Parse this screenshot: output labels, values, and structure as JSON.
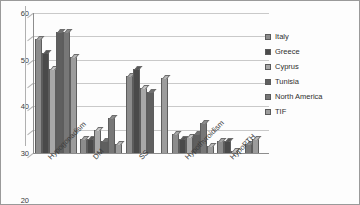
{
  "chart_data": {
    "type": "bar",
    "title": "",
    "subtitle": "",
    "xlabel": "",
    "ylabel": "",
    "ylim": [
      0,
      60
    ],
    "yticks": [
      0,
      10,
      20,
      30,
      40,
      50,
      60
    ],
    "grid": true,
    "legend_position": "right",
    "categories": [
      "Hypogonadism",
      "DM",
      "SS",
      "Hypothyroidism",
      "HypoPTH"
    ],
    "series": [
      {
        "name": "Italy",
        "color": "#8c8c8c",
        "values": [
          49,
          6,
          33,
          8,
          5
        ]
      },
      {
        "name": "Greece",
        "color": "#4a4a4a",
        "values": [
          43,
          6,
          36,
          6,
          5
        ]
      },
      {
        "name": "Cyprus",
        "color": "#a8a8a8",
        "values": [
          36,
          10,
          28,
          7,
          1
        ]
      },
      {
        "name": "Tunisia",
        "color": "#5f5f5f",
        "values": [
          52,
          5,
          26,
          8,
          0
        ]
      },
      {
        "name": "North America",
        "color": "#777777",
        "values": [
          52,
          15,
          0,
          13,
          4
        ]
      },
      {
        "name": "TIF",
        "color": "#9c9c9c",
        "values": [
          41,
          4,
          32,
          3,
          6
        ]
      }
    ]
  },
  "axis": {
    "y_tick_labels": [
      "0",
      "10",
      "20",
      "30",
      "40",
      "50",
      "60"
    ]
  },
  "colors": {
    "plot_background": "#fdfdfd",
    "grid": "#c9c9c9",
    "axis": "#8d8d8d",
    "border": "#9a9a9a",
    "text": "#3b3b3b"
  }
}
